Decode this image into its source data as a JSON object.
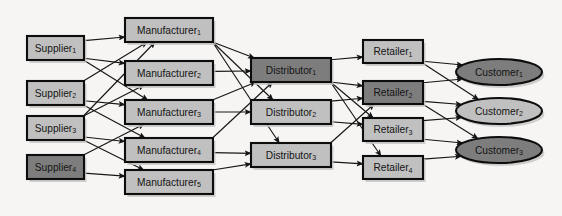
{
  "diagram": {
    "background_color": "#f6f5f3",
    "edge_color": "#161616",
    "border_color": "#0d0d0d",
    "fill_light": "#c0c0c0",
    "fill_dark": "#7d7d7d",
    "text_color": "#141414"
  },
  "tiers": [
    {
      "key": "supplier",
      "name": "Suppliers"
    },
    {
      "key": "manufacturer",
      "name": "Manufacturers"
    },
    {
      "key": "distributor",
      "name": "Distributors"
    },
    {
      "key": "retailer",
      "name": "Retailers"
    },
    {
      "key": "customer",
      "name": "Customers"
    }
  ],
  "nodes": [
    {
      "id": "S1",
      "tier": "supplier",
      "base": "Supplier",
      "sub": "1",
      "label": "Supplier1",
      "shape": "rect",
      "shade": "light",
      "x": 27,
      "y": 36,
      "w": 57,
      "h": 24
    },
    {
      "id": "S2",
      "tier": "supplier",
      "base": "Supplier",
      "sub": "2",
      "label": "Supplier2",
      "shape": "rect",
      "shade": "light",
      "x": 27,
      "y": 81,
      "w": 57,
      "h": 24
    },
    {
      "id": "S3",
      "tier": "supplier",
      "base": "Supplier",
      "sub": "3",
      "label": "Supplier3",
      "shape": "rect",
      "shade": "light",
      "x": 27,
      "y": 116,
      "w": 57,
      "h": 24
    },
    {
      "id": "S4",
      "tier": "supplier",
      "base": "Supplier",
      "sub": "4",
      "label": "Supplier4",
      "shape": "rect",
      "shade": "dark",
      "x": 27,
      "y": 155,
      "w": 57,
      "h": 24
    },
    {
      "id": "M1",
      "tier": "manufacturer",
      "base": "Manufacturer",
      "sub": "1",
      "label": "Manufacturer1",
      "shape": "rect",
      "shade": "light",
      "x": 125,
      "y": 18,
      "w": 88,
      "h": 24
    },
    {
      "id": "M2",
      "tier": "manufacturer",
      "base": "Manufacturer",
      "sub": "2",
      "label": "Manufacturer2",
      "shape": "rect",
      "shade": "light",
      "x": 125,
      "y": 61,
      "w": 88,
      "h": 24
    },
    {
      "id": "M3",
      "tier": "manufacturer",
      "base": "Manufacturer",
      "sub": "3",
      "label": "Manufacturer3",
      "shape": "rect",
      "shade": "light",
      "x": 125,
      "y": 100,
      "w": 88,
      "h": 24
    },
    {
      "id": "M4",
      "tier": "manufacturer",
      "base": "Manufacturer",
      "sub": "4",
      "label": "Manufacturer4",
      "shape": "rect",
      "shade": "light",
      "x": 125,
      "y": 138,
      "w": 88,
      "h": 24
    },
    {
      "id": "M5",
      "tier": "manufacturer",
      "base": "Manufacturer",
      "sub": "5",
      "label": "Manufacturer5",
      "shape": "rect",
      "shade": "light",
      "x": 125,
      "y": 170,
      "w": 88,
      "h": 24
    },
    {
      "id": "D1",
      "tier": "distributor",
      "base": "Distributor",
      "sub": "1",
      "label": "Distributor1",
      "shape": "rect",
      "shade": "dark",
      "x": 251,
      "y": 58,
      "w": 80,
      "h": 24
    },
    {
      "id": "D2",
      "tier": "distributor",
      "base": "Distributor",
      "sub": "2",
      "label": "Distributor2",
      "shape": "rect",
      "shade": "light",
      "x": 251,
      "y": 100,
      "w": 80,
      "h": 24
    },
    {
      "id": "D3",
      "tier": "distributor",
      "base": "Distributor",
      "sub": "3",
      "label": "Distributor3",
      "shape": "rect",
      "shade": "light",
      "x": 251,
      "y": 143,
      "w": 80,
      "h": 24
    },
    {
      "id": "R1",
      "tier": "retailer",
      "base": "Retailer",
      "sub": "1",
      "label": "Retailer1",
      "shape": "rect",
      "shade": "light",
      "x": 363,
      "y": 40,
      "w": 60,
      "h": 23
    },
    {
      "id": "R2",
      "tier": "retailer",
      "base": "Retailer",
      "sub": "2",
      "label": "Retailer2",
      "shape": "rect",
      "shade": "dark",
      "x": 363,
      "y": 81,
      "w": 60,
      "h": 23
    },
    {
      "id": "R3",
      "tier": "retailer",
      "base": "Retailer",
      "sub": "3",
      "label": "Retailer3",
      "shape": "rect",
      "shade": "light",
      "x": 363,
      "y": 118,
      "w": 60,
      "h": 23
    },
    {
      "id": "R4",
      "tier": "retailer",
      "base": "Retailer",
      "sub": "4",
      "label": "Retailer4",
      "shape": "rect",
      "shade": "light",
      "x": 363,
      "y": 156,
      "w": 60,
      "h": 23
    },
    {
      "id": "C1",
      "tier": "customer",
      "base": "Customer",
      "sub": "1",
      "label": "Customer1",
      "shape": "ellipse",
      "shade": "dark",
      "x": 456,
      "y": 59,
      "w": 86,
      "h": 26
    },
    {
      "id": "C2",
      "tier": "customer",
      "base": "Customer",
      "sub": "2",
      "label": "Customer2",
      "shape": "ellipse",
      "shade": "light",
      "x": 456,
      "y": 98,
      "w": 86,
      "h": 26
    },
    {
      "id": "C3",
      "tier": "customer",
      "base": "Customer",
      "sub": "3",
      "label": "Customer3",
      "shape": "ellipse",
      "shade": "dark",
      "x": 456,
      "y": 137,
      "w": 86,
      "h": 26
    }
  ],
  "edges": [
    {
      "from": "S1",
      "to": "M1"
    },
    {
      "from": "S1",
      "to": "M2"
    },
    {
      "from": "S1",
      "to": "M3"
    },
    {
      "from": "S2",
      "to": "M1"
    },
    {
      "from": "S2",
      "to": "M3"
    },
    {
      "from": "S2",
      "to": "M4"
    },
    {
      "from": "S3",
      "to": "M1"
    },
    {
      "from": "S3",
      "to": "M2"
    },
    {
      "from": "S3",
      "to": "M4"
    },
    {
      "from": "S3",
      "to": "M5"
    },
    {
      "from": "S4",
      "to": "M3"
    },
    {
      "from": "S4",
      "to": "M5"
    },
    {
      "from": "M1",
      "to": "D1"
    },
    {
      "from": "M1",
      "to": "D2"
    },
    {
      "from": "M1",
      "to": "D3"
    },
    {
      "from": "M2",
      "to": "D1"
    },
    {
      "from": "M3",
      "to": "D1"
    },
    {
      "from": "M3",
      "to": "D2"
    },
    {
      "from": "M4",
      "to": "D1"
    },
    {
      "from": "M4",
      "to": "D3"
    },
    {
      "from": "M5",
      "to": "D3"
    },
    {
      "from": "D1",
      "to": "R1"
    },
    {
      "from": "D1",
      "to": "R2"
    },
    {
      "from": "D1",
      "to": "R3"
    },
    {
      "from": "D1",
      "to": "R4"
    },
    {
      "from": "D2",
      "to": "R2"
    },
    {
      "from": "D2",
      "to": "R3"
    },
    {
      "from": "D3",
      "to": "R2"
    },
    {
      "from": "D3",
      "to": "R4"
    },
    {
      "from": "R1",
      "to": "C1"
    },
    {
      "from": "R1",
      "to": "C2"
    },
    {
      "from": "R2",
      "to": "C1"
    },
    {
      "from": "R2",
      "to": "C2"
    },
    {
      "from": "R2",
      "to": "C3"
    },
    {
      "from": "R3",
      "to": "C2"
    },
    {
      "from": "R3",
      "to": "C3"
    },
    {
      "from": "R4",
      "to": "C3"
    }
  ]
}
